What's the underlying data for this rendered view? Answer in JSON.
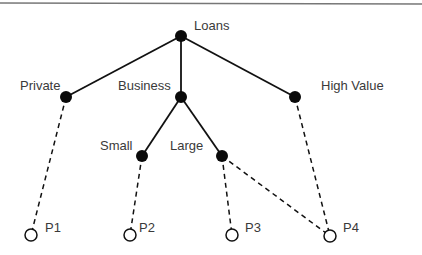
{
  "diagram": {
    "type": "hierarchy-tree",
    "top_rule": {
      "x1": 0,
      "y1": 3,
      "x2": 422,
      "y2": 4,
      "color": "#777777"
    },
    "nodes": [
      {
        "id": "loans",
        "label": "Loans",
        "x": 181,
        "y": 36,
        "style": "filled",
        "label_x": 194,
        "label_y": 30,
        "anchor": "start"
      },
      {
        "id": "private",
        "label": "Private",
        "x": 66,
        "y": 97,
        "style": "filled",
        "label_x": 20,
        "label_y": 90,
        "anchor": "start"
      },
      {
        "id": "business",
        "label": "Business",
        "x": 181,
        "y": 97,
        "style": "filled",
        "label_x": 118,
        "label_y": 90,
        "anchor": "start"
      },
      {
        "id": "high-value",
        "label": "High Value",
        "x": 295,
        "y": 97,
        "style": "filled",
        "label_x": 321,
        "label_y": 90,
        "anchor": "start"
      },
      {
        "id": "small",
        "label": "Small",
        "x": 142,
        "y": 156,
        "style": "filled",
        "label_x": 100,
        "label_y": 150,
        "anchor": "start"
      },
      {
        "id": "large",
        "label": "Large",
        "x": 222,
        "y": 156,
        "style": "filled",
        "label_x": 170,
        "label_y": 150,
        "anchor": "start"
      },
      {
        "id": "p1",
        "label": "P1",
        "x": 31,
        "y": 235,
        "style": "open",
        "label_x": 45,
        "label_y": 232,
        "anchor": "start"
      },
      {
        "id": "p2",
        "label": "P2",
        "x": 130,
        "y": 235,
        "style": "open",
        "label_x": 139,
        "label_y": 232,
        "anchor": "start"
      },
      {
        "id": "p3",
        "label": "P3",
        "x": 232,
        "y": 235,
        "style": "open",
        "label_x": 245,
        "label_y": 232,
        "anchor": "start"
      },
      {
        "id": "p4",
        "label": "P4",
        "x": 330,
        "y": 236,
        "style": "open",
        "label_x": 343,
        "label_y": 232,
        "anchor": "start"
      }
    ],
    "edges": [
      {
        "from": "loans",
        "to": "private",
        "style": "solid"
      },
      {
        "from": "loans",
        "to": "business",
        "style": "solid"
      },
      {
        "from": "loans",
        "to": "high-value",
        "style": "solid"
      },
      {
        "from": "business",
        "to": "small",
        "style": "solid"
      },
      {
        "from": "business",
        "to": "large",
        "style": "solid"
      },
      {
        "from": "private",
        "to": "p1",
        "style": "dashed"
      },
      {
        "from": "small",
        "to": "p2",
        "style": "dashed"
      },
      {
        "from": "large",
        "to": "p3",
        "style": "dashed"
      },
      {
        "from": "large",
        "to": "p4",
        "style": "dashed"
      },
      {
        "from": "high-value",
        "to": "p4",
        "style": "dashed"
      }
    ],
    "node_radius": 6
  }
}
